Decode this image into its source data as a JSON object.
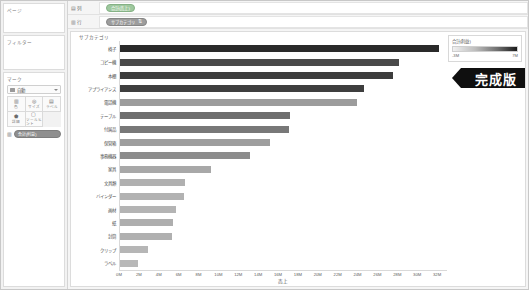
{
  "sidebar": {
    "pages_title": "ページ",
    "filters_title": "フィルター",
    "marks_title": "マーク",
    "marks_type": "自動",
    "marks_type_icon": "bar-mark-icon",
    "mark_buttons": [
      {
        "icon": "color-icon",
        "label": "色"
      },
      {
        "icon": "size-icon",
        "label": "サイズ"
      },
      {
        "icon": "text-icon",
        "label": "ラベル"
      },
      {
        "icon": "detail-icon",
        "label": "詳細"
      },
      {
        "icon": "tooltip-icon",
        "label": "ツールヒント"
      }
    ],
    "marks_pill": "合計(利益)"
  },
  "shelves": [
    {
      "name": "列",
      "icon": "columns-icon",
      "pill": "合計(売上)",
      "pill_type": "green",
      "sort": ""
    },
    {
      "name": "行",
      "icon": "rows-icon",
      "pill": "サブカテゴリ",
      "pill_type": "blue",
      "sort": "⇅"
    }
  ],
  "legend": {
    "title": "合計(利益)",
    "min": "-3M",
    "max": "7M"
  },
  "badge": {
    "label": "完成版"
  },
  "chart_data": {
    "type": "bar",
    "title": "",
    "orientation": "horizontal",
    "row_header": "サブカテゴリ",
    "xlabel": "売上",
    "ylabel": "",
    "xlim": [
      0,
      33
    ],
    "unit": "M",
    "grid": false,
    "legend_position": "right",
    "color_series_name": "合計(利益)",
    "color_range": [
      -3,
      7
    ],
    "categories": [
      "椅子",
      "コピー機",
      "本棚",
      "アプライアンス",
      "電話機",
      "テーブル",
      "付属品",
      "保管箱",
      "事務機器",
      "家具",
      "文具類",
      "バインダー",
      "画材",
      "紙",
      "封筒",
      "クリップ",
      "ラベル"
    ],
    "values": [
      32.2,
      28.2,
      27.6,
      24.6,
      23.9,
      17.2,
      17.1,
      15.1,
      13.1,
      9.2,
      6.6,
      6.5,
      5.7,
      5.3,
      5.2,
      2.8,
      1.8
    ],
    "profit": [
      3.4,
      7.0,
      5.4,
      5.2,
      2.1,
      -1.9,
      1.9,
      1.0,
      1.3,
      0.6,
      0.8,
      0.7,
      0.6,
      0.9,
      0.8,
      0.6,
      0.5
    ],
    "x_ticks": [
      "0M",
      "2M",
      "4M",
      "6M",
      "8M",
      "10M",
      "12M",
      "14M",
      "16M",
      "18M",
      "20M",
      "22M",
      "24M",
      "26M",
      "28M",
      "30M",
      "32M"
    ],
    "bar_colors": [
      "#2a2a2a",
      "#4a4a4a",
      "#3c3c3c",
      "#3e3e3e",
      "#9c9c9c",
      "#6e6e6e",
      "#787878",
      "#9e9e9e",
      "#8c8c8c",
      "#a8a8a8",
      "#b0b0b0",
      "#b2b2b2",
      "#b4b4b4",
      "#aeaeae",
      "#b0b0b0",
      "#b6b6b6",
      "#b8b8b8"
    ]
  }
}
